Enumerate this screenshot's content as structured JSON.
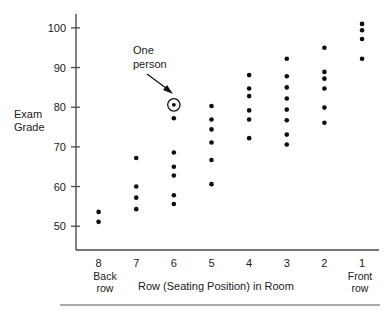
{
  "chart_data": {
    "type": "scatter",
    "title": "",
    "xlabel": "Row (Seating Position) in Room",
    "ylabel": "Exam Grade",
    "ylabel_line1": "Exam",
    "ylabel_line2": "Grade",
    "xlim": [
      8.6,
      0.55
    ],
    "ylim": [
      44,
      103.5
    ],
    "x_axis_inverted": true,
    "grid": false,
    "legend": null,
    "x_tick_labels": [
      "8",
      "7",
      "6",
      "5",
      "4",
      "3",
      "2",
      "1"
    ],
    "x_tick_values": [
      8,
      7,
      6,
      5,
      4,
      3,
      2,
      1
    ],
    "y_tick_labels": [
      "50",
      "60",
      "70",
      "80",
      "90",
      "100"
    ],
    "y_tick_values": [
      50,
      60,
      70,
      80,
      90,
      100
    ],
    "edge_labels": {
      "left_line1": "Back",
      "left_line2": "row",
      "right_line1": "Front",
      "right_line2": "row"
    },
    "annotations": [
      {
        "text_line1": "One",
        "text_line2": "person",
        "points_to_row": 6,
        "points_to_grade": 80.6,
        "marker": "circled-dot"
      }
    ],
    "series": [
      {
        "name": "Students",
        "points": [
          {
            "row": 8,
            "grade": 53.6
          },
          {
            "row": 8,
            "grade": 51.1
          },
          {
            "row": 7,
            "grade": 67.2
          },
          {
            "row": 7,
            "grade": 60.0
          },
          {
            "row": 7,
            "grade": 57.2
          },
          {
            "row": 7,
            "grade": 54.3
          },
          {
            "row": 6,
            "grade": 80.6
          },
          {
            "row": 6,
            "grade": 77.2
          },
          {
            "row": 6,
            "grade": 68.6
          },
          {
            "row": 6,
            "grade": 65.0
          },
          {
            "row": 6,
            "grade": 62.8
          },
          {
            "row": 6,
            "grade": 57.8
          },
          {
            "row": 6,
            "grade": 55.6
          },
          {
            "row": 5,
            "grade": 80.3
          },
          {
            "row": 5,
            "grade": 76.9
          },
          {
            "row": 5,
            "grade": 74.4
          },
          {
            "row": 5,
            "grade": 71.1
          },
          {
            "row": 5,
            "grade": 66.7
          },
          {
            "row": 5,
            "grade": 60.6
          },
          {
            "row": 4,
            "grade": 88.1
          },
          {
            "row": 4,
            "grade": 84.7
          },
          {
            "row": 4,
            "grade": 82.8
          },
          {
            "row": 4,
            "grade": 79.2
          },
          {
            "row": 4,
            "grade": 76.9
          },
          {
            "row": 4,
            "grade": 72.2
          },
          {
            "row": 3,
            "grade": 92.2
          },
          {
            "row": 3,
            "grade": 87.8
          },
          {
            "row": 3,
            "grade": 85.0
          },
          {
            "row": 3,
            "grade": 82.2
          },
          {
            "row": 3,
            "grade": 79.4
          },
          {
            "row": 3,
            "grade": 76.7
          },
          {
            "row": 3,
            "grade": 73.1
          },
          {
            "row": 3,
            "grade": 70.6
          },
          {
            "row": 2,
            "grade": 95.0
          },
          {
            "row": 2,
            "grade": 88.9
          },
          {
            "row": 2,
            "grade": 87.2
          },
          {
            "row": 2,
            "grade": 84.7
          },
          {
            "row": 2,
            "grade": 79.9
          },
          {
            "row": 2,
            "grade": 76.1
          },
          {
            "row": 1,
            "grade": 101.0
          },
          {
            "row": 1,
            "grade": 99.4
          },
          {
            "row": 1,
            "grade": 97.2
          },
          {
            "row": 1,
            "grade": 92.2
          }
        ]
      }
    ]
  }
}
